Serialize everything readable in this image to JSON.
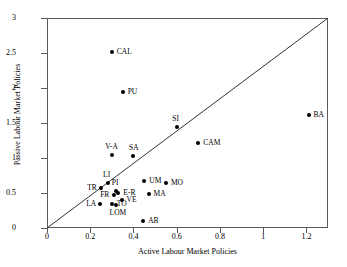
{
  "chart_data": {
    "type": "scatter",
    "title": "",
    "xlabel": "Active Labour Market Policies",
    "ylabel": "Passive Labour Market Policies",
    "xlim": [
      0,
      1.3
    ],
    "ylim": [
      0,
      3
    ],
    "xticks": [
      "0",
      "0.2",
      "0.4",
      "0.6",
      "0.8",
      "1",
      "1.2"
    ],
    "xtick_values": [
      0,
      0.2,
      0.4,
      0.6,
      0.8,
      1,
      1.2
    ],
    "yticks": [
      "0",
      "0.5",
      "1",
      "1.5",
      "2",
      "2.5",
      "3"
    ],
    "ytick_values": [
      0,
      0.5,
      1,
      1.5,
      2,
      2.5,
      3
    ],
    "grid": false,
    "legend": "none",
    "reference_line": {
      "type": "diagonal-45-degree",
      "from": [
        0,
        0
      ],
      "to": [
        1.3,
        3
      ]
    },
    "points": [
      {
        "label": "CAL",
        "x": 0.3,
        "y": 2.51,
        "label_pos": "right"
      },
      {
        "label": "PU",
        "x": 0.35,
        "y": 1.95,
        "label_pos": "right"
      },
      {
        "label": "BA",
        "x": 1.21,
        "y": 1.62,
        "label_pos": "right"
      },
      {
        "label": "SI",
        "x": 0.6,
        "y": 1.45,
        "label_pos": "above"
      },
      {
        "label": "CAM",
        "x": 0.7,
        "y": 1.22,
        "label_pos": "right"
      },
      {
        "label": "V-A",
        "x": 0.3,
        "y": 1.04,
        "label_pos": "above"
      },
      {
        "label": "SA",
        "x": 0.4,
        "y": 1.03,
        "label_pos": "above"
      },
      {
        "label": "UM",
        "x": 0.45,
        "y": 0.67,
        "label_pos": "right"
      },
      {
        "label": "LI",
        "x": 0.28,
        "y": 0.65,
        "label_pos": "above"
      },
      {
        "label": "MO",
        "x": 0.55,
        "y": 0.64,
        "label_pos": "right"
      },
      {
        "label": "TR",
        "x": 0.25,
        "y": 0.57,
        "label_pos": "left"
      },
      {
        "label": "PI",
        "x": 0.32,
        "y": 0.53,
        "label_pos": "above"
      },
      {
        "label": "E-R",
        "x": 0.33,
        "y": 0.5,
        "label_pos": "right"
      },
      {
        "label": "MA",
        "x": 0.47,
        "y": 0.49,
        "label_pos": "right"
      },
      {
        "label": "FR",
        "x": 0.31,
        "y": 0.47,
        "label_pos": "left"
      },
      {
        "label": "VE",
        "x": 0.345,
        "y": 0.4,
        "label_pos": "right"
      },
      {
        "label": "LA",
        "x": 0.245,
        "y": 0.35,
        "label_pos": "left"
      },
      {
        "label": "TO",
        "x": 0.3,
        "y": 0.35,
        "label_pos": "right"
      },
      {
        "label": "LOM",
        "x": 0.32,
        "y": 0.33,
        "label_pos": "below"
      },
      {
        "label": "AB",
        "x": 0.445,
        "y": 0.1,
        "label_pos": "right"
      }
    ]
  },
  "colors": {
    "marker": "#000000",
    "axis": "#5a5a5a",
    "reference_line": "#333333",
    "background": "#ffffff"
  }
}
